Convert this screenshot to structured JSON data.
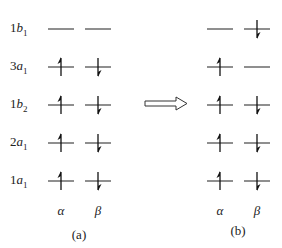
{
  "diagram": {
    "orbitals": [
      {
        "num": "1",
        "letter": "b",
        "sub": "1",
        "y": 29,
        "a": {
          "alpha": false,
          "beta": false
        },
        "b": {
          "alpha": false,
          "beta": true
        }
      },
      {
        "num": "3",
        "letter": "a",
        "sub": "1",
        "y": 67,
        "a": {
          "alpha": true,
          "beta": true
        },
        "b": {
          "alpha": true,
          "beta": false
        }
      },
      {
        "num": "1",
        "letter": "b",
        "sub": "2",
        "y": 105,
        "a": {
          "alpha": true,
          "beta": true
        },
        "b": {
          "alpha": true,
          "beta": true
        }
      },
      {
        "num": "2",
        "letter": "a",
        "sub": "1",
        "y": 143,
        "a": {
          "alpha": true,
          "beta": true
        },
        "b": {
          "alpha": true,
          "beta": true
        }
      },
      {
        "num": "1",
        "letter": "a",
        "sub": "1",
        "y": 181,
        "a": {
          "alpha": true,
          "beta": true
        },
        "b": {
          "alpha": true,
          "beta": true
        }
      }
    ],
    "spin_labels": {
      "alpha": "α",
      "beta": "β"
    },
    "panels": {
      "a": {
        "label": "(a)",
        "alpha_x": 61,
        "beta_x": 98
      },
      "b": {
        "label": "(b)",
        "alpha_x": 220,
        "beta_x": 257
      }
    },
    "arrow": {
      "direction": "right",
      "meaning": "transition from (a) to (b)"
    }
  }
}
